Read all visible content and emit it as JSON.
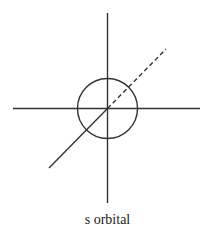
{
  "diagram": {
    "title": "s orbital",
    "caption": "s orbital",
    "stroke_color": "#333333",
    "background": "#ffffff",
    "center": [
      107.5,
      108.5
    ],
    "axes": {
      "vertical": {
        "x": 107.5,
        "y1": 13,
        "y2": 203
      },
      "horizontal": {
        "y": 108.5,
        "x1": 13,
        "x2": 200
      },
      "diagonal_front": {
        "x1": 49,
        "y1": 168,
        "x2": 107.5,
        "y2": 108.5,
        "style": "solid"
      },
      "diagonal_back": {
        "x1": 107.5,
        "y1": 108.5,
        "x2": 166,
        "y2": 49,
        "style": "dashed"
      }
    },
    "orbital_sphere": {
      "shape": "circle",
      "cx": 107.5,
      "cy": 108.5,
      "r": 30
    }
  }
}
